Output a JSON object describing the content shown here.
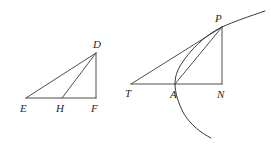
{
  "figure": {
    "background_color": "#ffffff",
    "stroke_color": "#3a3a3a",
    "label_color": "#262626",
    "left_figure": {
      "name": "triangle-EDF",
      "description": "Right triangle E-D-F with right angle at F and cevian D-H",
      "points": [
        {
          "id": "E",
          "label": "E",
          "x": 26,
          "y": 98,
          "label_x": 20,
          "label_y": 112
        },
        {
          "id": "H",
          "label": "H",
          "x": 62,
          "y": 98,
          "label_x": 56,
          "label_y": 112
        },
        {
          "id": "F",
          "label": "F",
          "x": 96,
          "y": 98,
          "label_x": 91,
          "label_y": 112
        },
        {
          "id": "D",
          "label": "D",
          "x": 96,
          "y": 53,
          "label_x": 93,
          "label_y": 48
        }
      ],
      "segments": [
        {
          "name": "segment-EF",
          "from": "E",
          "to": "F"
        },
        {
          "name": "segment-ED",
          "from": "E",
          "to": "D"
        },
        {
          "name": "segment-FD",
          "from": "F",
          "to": "D"
        },
        {
          "name": "segment-HD",
          "from": "H",
          "to": "D"
        }
      ]
    },
    "right_figure": {
      "name": "parabola-tangent-TAPN",
      "description": "Parabola through vertex A and point P, with tangent line T-P, chord A-P, ordinate P-N and axis segment T-N",
      "points": [
        {
          "id": "T",
          "label": "T",
          "x": 131,
          "y": 84,
          "label_x": 125,
          "label_y": 97
        },
        {
          "id": "A",
          "label": "A",
          "x": 175,
          "y": 84,
          "label_x": 170,
          "label_y": 98
        },
        {
          "id": "N",
          "label": "N",
          "x": 222,
          "y": 84,
          "label_x": 217,
          "label_y": 98
        },
        {
          "id": "P",
          "label": "P",
          "x": 222,
          "y": 27,
          "label_x": 215,
          "label_y": 22
        }
      ],
      "segments": [
        {
          "name": "segment-TN",
          "from": "T",
          "to": "N"
        },
        {
          "name": "segment-TP",
          "from": "T",
          "to": "P"
        },
        {
          "name": "segment-AP",
          "from": "A",
          "to": "P"
        },
        {
          "name": "segment-PN",
          "from": "P",
          "to": "N"
        }
      ],
      "curve": {
        "name": "parabola-arc",
        "through_points": [
          "upper-right-end",
          "P",
          "A",
          "lower-right-end"
        ],
        "upper_right_end": {
          "x": 265,
          "y": 11
        },
        "lower_right_end": {
          "x": 211,
          "y": 138
        }
      }
    }
  }
}
